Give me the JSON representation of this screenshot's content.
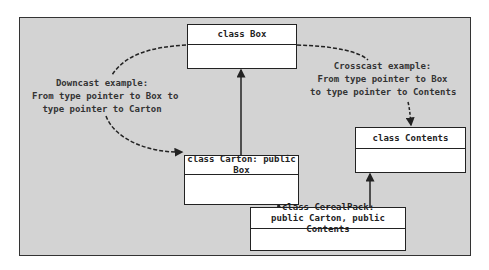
{
  "diagram": {
    "classes": {
      "box": {
        "name": "class Box"
      },
      "carton": {
        "name": "class Carton: public Box"
      },
      "contents": {
        "name": "class Contents"
      },
      "cerealpack": {
        "line1": "class CerealPack:",
        "line2": "public Carton, public Contents"
      }
    },
    "notes": {
      "downcast": {
        "line1": "Downcast example:",
        "line2": "From type pointer to Box to",
        "line3": "type pointer to Carton"
      },
      "crosscast": {
        "line1": "Crosscast example:",
        "line2": "From type pointer to Box",
        "line3": "to type pointer to Contents"
      }
    },
    "relations": [
      {
        "from": "Carton",
        "to": "Box",
        "type": "inheritance"
      },
      {
        "from": "CerealPack",
        "to": "Carton",
        "type": "inheritance"
      },
      {
        "from": "CerealPack",
        "to": "Contents",
        "type": "inheritance"
      },
      {
        "from": "Box",
        "to": "Carton",
        "type": "downcast",
        "style": "dashed"
      },
      {
        "from": "Box",
        "to": "Contents",
        "type": "crosscast",
        "style": "dashed"
      }
    ],
    "colors": {
      "background": "#d3d3d3",
      "box_fill": "#ffffff",
      "line": "#222222"
    }
  }
}
